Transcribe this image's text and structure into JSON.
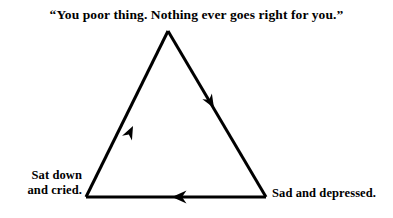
{
  "figure": {
    "background_color": "#ffffff",
    "ink_color": "#000000",
    "caption": "“You poor thing.  Nothing ever goes right for you.”",
    "diagram_type": "cycle-triangle",
    "stroke_width": 3,
    "nodes": [
      {
        "id": "top",
        "label": "",
        "x": 168,
        "y": 31
      },
      {
        "id": "bottom-left",
        "label_line_1": "Sat down",
        "label_line_2": "and cried.",
        "x": 86,
        "y": 197
      },
      {
        "id": "bottom-right",
        "label": "Sad and depressed.",
        "x": 266,
        "y": 197
      }
    ],
    "edges": [
      {
        "id": "left-edge",
        "from": "bottom-left",
        "to": "top",
        "arrow": "up-right",
        "arrow_position": 0.62
      },
      {
        "id": "right-edge",
        "from": "top",
        "to": "bottom-right",
        "arrow": "down-right",
        "arrow_position": 0.47
      },
      {
        "id": "bottom-edge",
        "from": "bottom-right",
        "to": "bottom-left",
        "arrow": "left",
        "arrow_position": 0.52
      }
    ]
  }
}
